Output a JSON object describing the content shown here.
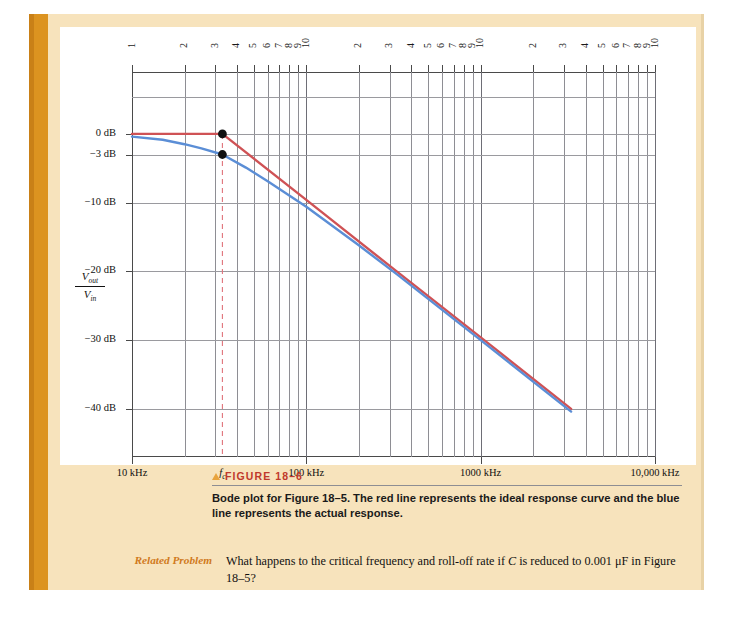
{
  "page": {
    "background_color": "#ffffff",
    "cream_color": "#f7e3bc",
    "spine_color": "#dc9320"
  },
  "chart_data": {
    "type": "line",
    "title": "",
    "xlabel": "",
    "ylabel": "Vout/Vin",
    "x_scale": "log",
    "x_axis_unit": "kHz",
    "x_tick_labels": [
      "10 kHz",
      "fc",
      "100 kHz",
      "1000 kHz",
      "10,000 kHz"
    ],
    "x_decade_labels": [
      "1",
      "2",
      "3",
      "4",
      "5",
      "6",
      "7",
      "8",
      "9",
      "10",
      "2",
      "3",
      "4",
      "5",
      "6",
      "7",
      "8",
      "9",
      "10",
      "2",
      "3",
      "4",
      "5",
      "6",
      "7",
      "8",
      "9",
      "10"
    ],
    "x_range_khz": [
      10,
      10000
    ],
    "y_tick_labels": [
      "0 dB",
      "−3 dB",
      "−10 dB",
      "−20 dB",
      "−30 dB",
      "−40 dB"
    ],
    "y_tick_values": [
      0,
      -3,
      -10,
      -20,
      -30,
      -40
    ],
    "ylim": [
      -47,
      9
    ],
    "grid": true,
    "legend_position": "none",
    "critical_frequency_khz": 33,
    "critical_frequency_label": "fc",
    "rolloff_db_per_decade": -20,
    "series": [
      {
        "name": "ideal response curve",
        "color": "#cf5255",
        "points_db": [
          {
            "f_khz": 10,
            "db": 0
          },
          {
            "f_khz": 33,
            "db": 0
          },
          {
            "f_khz": 100,
            "db": -9.6
          },
          {
            "f_khz": 330,
            "db": -20
          },
          {
            "f_khz": 1000,
            "db": -29.6
          },
          {
            "f_khz": 3300,
            "db": -40
          }
        ]
      },
      {
        "name": "actual response",
        "color": "#5b8ed6",
        "points_db": [
          {
            "f_khz": 10,
            "db": -0.4
          },
          {
            "f_khz": 15,
            "db": -0.85
          },
          {
            "f_khz": 20,
            "db": -1.5
          },
          {
            "f_khz": 25,
            "db": -2.1
          },
          {
            "f_khz": 33,
            "db": -3
          },
          {
            "f_khz": 45,
            "db": -4.9
          },
          {
            "f_khz": 60,
            "db": -6.9
          },
          {
            "f_khz": 100,
            "db": -10.6
          },
          {
            "f_khz": 200,
            "db": -16.2
          },
          {
            "f_khz": 330,
            "db": -20.4
          },
          {
            "f_khz": 1000,
            "db": -30
          },
          {
            "f_khz": 3300,
            "db": -40.4
          }
        ]
      }
    ],
    "annotations": [
      {
        "name": "fc-dashed-line",
        "type": "vline",
        "f_khz": 33,
        "color": "#e0737a",
        "style": "dashed"
      },
      {
        "name": "ideal-corner-dot",
        "type": "point",
        "f_khz": 33,
        "db": 0,
        "color": "#111111"
      },
      {
        "name": "minus3db-dot",
        "type": "point",
        "f_khz": 33,
        "db": -3,
        "color": "#111111"
      }
    ]
  },
  "y_axis": {
    "fraction_numerator": "V",
    "fraction_numerator_sub": "out",
    "fraction_denominator": "V",
    "fraction_denominator_sub": "in"
  },
  "caption": {
    "figure_label": "FIGURE 18–6",
    "body": "Bode plot for Figure 18–5. The red line represents the ideal response curve and the blue line represents the actual response.",
    "label_color": "#c0392b",
    "triangle_icon": "triangle-up-icon"
  },
  "related_problem": {
    "label": "Related Problem",
    "text_part1": "What happens to the critical frequency and roll-off rate if ",
    "italic_c": "C",
    "text_part2": " is reduced to 0.001 μF in Figure 18–5?",
    "label_color": "#d07a1c"
  }
}
